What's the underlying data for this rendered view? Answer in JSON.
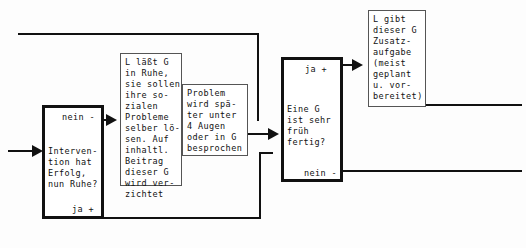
{
  "diagram": {
    "line_color": "#111111",
    "background": "#fdfdfd"
  },
  "nodes": {
    "decision_intervention": {
      "text": "Interven-\ntion hat\nErfolg,\nnun Ruhe?",
      "label_no": "nein -",
      "label_yes": "ja +"
    },
    "action_ruhe": {
      "text": "L läßt G\nin Ruhe,\nsie sollen\nihre so-\nzialen\nProbleme\nselber lö-\nsen. Auf\ninhaltl.\nBeitrag\ndieser G\nwird ver-\nzichtet"
    },
    "action_problem": {
      "text": "Problem\nwird spä-\nter unter\n4 Augen\noder in G\nbesprochen"
    },
    "decision_fertig": {
      "text": "Eine G\nist sehr\nfrüh\nfertig?",
      "label_yes": "ja +",
      "label_no": "nein -"
    },
    "action_zusatz": {
      "text": "L gibt\ndieser G\nZusatz-\naufgabe\n(meist\ngeplant\nu. vor-\nbereitet)"
    }
  }
}
